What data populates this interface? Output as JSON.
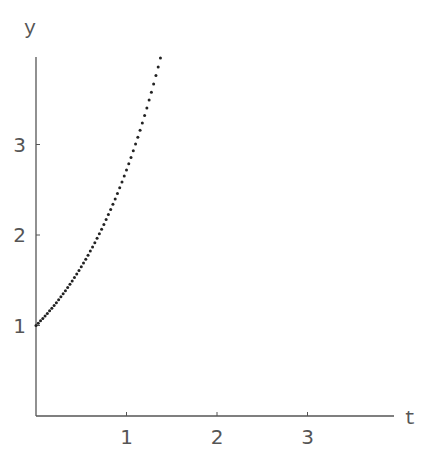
{
  "chart_data": {
    "type": "scatter",
    "title": "",
    "xlabel": "t",
    "ylabel": "y",
    "xlim": [
      0,
      3.9
    ],
    "ylim": [
      0,
      3.95
    ],
    "x_ticks": [
      "1",
      "2",
      "3"
    ],
    "y_ticks": [
      "1",
      "2",
      "3"
    ],
    "grid": false,
    "legend": null,
    "series": [
      {
        "name": "y = e^t (points)",
        "function": "exp",
        "t_start": 0,
        "t_end": 1.386,
        "t_step": 0.025,
        "marker_color": "#222222"
      }
    ]
  },
  "axes": {
    "x_label": "t",
    "y_label": "y",
    "axis_color": "#555555"
  }
}
